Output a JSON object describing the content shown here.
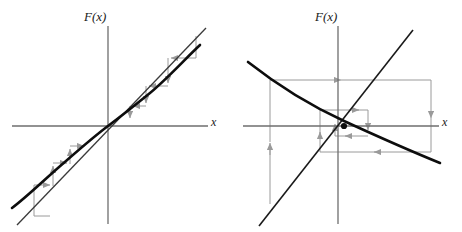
{
  "figure": {
    "title": "",
    "background_color": "#ffffff",
    "width": 462,
    "height": 232
  },
  "colors": {
    "curve": "#0d0d0d",
    "diagonal": "#3a3a3a",
    "axis": "#6e6e6e",
    "cobweb": "#9a9a9a",
    "label_text": "#1a1a1a"
  },
  "panels": [
    {
      "id": "left",
      "name": "increasing-map-staircase",
      "y_axis_label": "F(x)",
      "x_axis_label": "x",
      "origin": {
        "x": 108,
        "y": 126
      },
      "axes": {
        "x_axis": {
          "x1": 12,
          "y1": 126,
          "x2": 208,
          "y2": 126
        },
        "y_axis": {
          "x1": 108,
          "y1": 26,
          "x2": 108,
          "y2": 224
        }
      },
      "diagonal": {
        "x1": 17,
        "y1": 225,
        "x2": 206,
        "y2": 28,
        "label": "y = x"
      },
      "curve": {
        "label": "F(x)",
        "shape": "increasing-cubic-S",
        "points": [
          [
            12,
            208
          ],
          [
            20,
            200
          ],
          [
            30,
            190
          ],
          [
            42,
            180
          ],
          [
            55,
            169
          ],
          [
            68,
            158
          ],
          [
            80,
            149
          ],
          [
            90,
            141
          ],
          [
            98,
            134
          ],
          [
            104,
            129
          ],
          [
            108,
            126
          ],
          [
            112,
            123
          ],
          [
            118,
            118
          ],
          [
            126,
            112
          ],
          [
            136,
            104
          ],
          [
            148,
            95
          ],
          [
            160,
            84
          ],
          [
            172,
            73
          ],
          [
            184,
            62
          ],
          [
            194,
            52
          ],
          [
            200,
            45
          ]
        ]
      },
      "cobweb": {
        "direction": "outward-staircase",
        "description": "staircase iteration moving away from the repelling fixed point at the origin",
        "segments": [
          {
            "type": "vertical",
            "x": 34,
            "y1": 216,
            "y2": 185,
            "arrow": "none"
          },
          {
            "type": "horizontal",
            "y": 185,
            "x1": 34,
            "x2": 53,
            "arrow": "right"
          },
          {
            "type": "vertical",
            "x": 53,
            "y1": 185,
            "y2": 163,
            "arrow": "up"
          },
          {
            "type": "horizontal",
            "y": 163,
            "x1": 53,
            "x2": 70,
            "arrow": "right"
          },
          {
            "type": "vertical",
            "x": 70,
            "y1": 163,
            "y2": 146,
            "arrow": "up"
          },
          {
            "type": "horizontal",
            "y": 146,
            "x1": 70,
            "x2": 86,
            "arrow": "right"
          },
          {
            "type": "vertical",
            "x": 130,
            "y1": 106,
            "y2": 120,
            "arrow": "down"
          },
          {
            "type": "horizontal",
            "y": 106,
            "x1": 146,
            "x2": 130,
            "arrow": "left"
          },
          {
            "type": "vertical",
            "x": 146,
            "y1": 86,
            "y2": 106,
            "arrow": "down"
          },
          {
            "type": "horizontal",
            "y": 86,
            "x1": 168,
            "x2": 146,
            "arrow": "left"
          },
          {
            "type": "vertical",
            "x": 168,
            "y1": 58,
            "y2": 86,
            "arrow": "down"
          },
          {
            "type": "horizontal",
            "y": 58,
            "x1": 196,
            "x2": 168,
            "arrow": "left"
          },
          {
            "type": "vertical",
            "x": 196,
            "y1": 36,
            "y2": 58,
            "arrow": "none"
          }
        ]
      }
    },
    {
      "id": "right",
      "name": "decreasing-map-spiral",
      "y_axis_label": "F(x)",
      "x_axis_label": "x",
      "origin": {
        "x": 107,
        "y": 126
      },
      "axes": {
        "x_axis": {
          "x1": 12,
          "y1": 126,
          "x2": 208,
          "y2": 126
        },
        "y_axis": {
          "x1": 107,
          "y1": 26,
          "x2": 107,
          "y2": 224
        }
      },
      "diagonal": {
        "x1": 28,
        "y1": 226,
        "x2": 182,
        "y2": 30,
        "label": "y = x"
      },
      "curve": {
        "label": "F(x)",
        "shape": "decreasing-convex",
        "points": [
          [
            17,
            62
          ],
          [
            30,
            72
          ],
          [
            44,
            83
          ],
          [
            58,
            93
          ],
          [
            72,
            102
          ],
          [
            86,
            110
          ],
          [
            100,
            118
          ],
          [
            113,
            124
          ],
          [
            126,
            131
          ],
          [
            140,
            137
          ],
          [
            154,
            143
          ],
          [
            168,
            149
          ],
          [
            182,
            154
          ],
          [
            196,
            159
          ],
          [
            209,
            163
          ]
        ]
      },
      "cobweb": {
        "direction": "inward-spiral",
        "description": "spiralling iteration converging to the attracting fixed point",
        "fixed_point": {
          "x": 113,
          "y": 126
        },
        "segments": [
          {
            "type": "vertical",
            "x": 39,
            "y1": 204,
            "y2": 80,
            "arrow": "up"
          },
          {
            "type": "horizontal",
            "y": 80,
            "x1": 39,
            "x2": 200,
            "arrow": "right"
          },
          {
            "type": "vertical",
            "x": 200,
            "y1": 80,
            "y2": 152,
            "arrow": "down"
          },
          {
            "type": "horizontal",
            "y": 152,
            "x1": 200,
            "x2": 89,
            "arrow": "left"
          },
          {
            "type": "vertical",
            "x": 89,
            "y1": 152,
            "y2": 110,
            "arrow": "up"
          },
          {
            "type": "horizontal",
            "y": 110,
            "x1": 89,
            "x2": 137,
            "arrow": "right"
          },
          {
            "type": "vertical",
            "x": 137,
            "y1": 110,
            "y2": 136,
            "arrow": "down"
          },
          {
            "type": "horizontal",
            "y": 136,
            "x1": 137,
            "x2": 104,
            "arrow": "left"
          },
          {
            "type": "vertical",
            "x": 104,
            "y1": 136,
            "y2": 118,
            "arrow": "up"
          }
        ]
      }
    }
  ]
}
